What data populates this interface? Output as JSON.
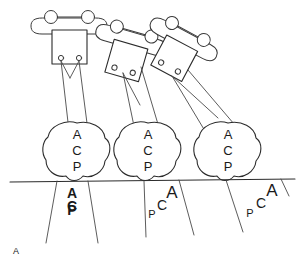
{
  "figure": {
    "panel_label": "A",
    "caption_label": "A",
    "background_color": "#ffffff",
    "ink_color": "#2b2b2b",
    "width": 303,
    "height": 269
  },
  "ground_line": {
    "name": "horizontal-reference-line",
    "y": 180,
    "x_start": 10,
    "x_end": 295
  },
  "devices": [
    {
      "id": "device-left",
      "label": "",
      "rotation_deg": 0,
      "center_x": 66,
      "center_y": 36,
      "port_count": 2,
      "knob_count": 2
    },
    {
      "id": "device-middle",
      "label": "",
      "rotation_deg": 18,
      "center_x": 130,
      "center_y": 46,
      "port_count": 2,
      "knob_count": 2
    },
    {
      "id": "device-right",
      "label": "",
      "rotation_deg": 30,
      "center_x": 176,
      "center_y": 52,
      "port_count": 2,
      "knob_count": 2
    }
  ],
  "somas": [
    {
      "id": "soma-left",
      "center_x": 77,
      "center_y": 150,
      "letters": [
        "A",
        "C",
        "P"
      ]
    },
    {
      "id": "soma-middle",
      "center_x": 148,
      "center_y": 150,
      "letters": [
        "A",
        "C",
        "P"
      ]
    },
    {
      "id": "soma-right",
      "center_x": 228,
      "center_y": 150,
      "letters": [
        "A",
        "C",
        "P"
      ]
    }
  ],
  "below_line_marks": [
    {
      "id": "mark-left",
      "style": "stacked-bold-overlapping",
      "letters": [
        "A",
        "C",
        "P"
      ],
      "x": 73,
      "y": 196
    },
    {
      "id": "mark-middle",
      "style": "diagonal-graded",
      "letters": [
        "A",
        "C",
        "P"
      ],
      "x": 165,
      "y": 200
    },
    {
      "id": "mark-right",
      "style": "diagonal-graded",
      "letters": [
        "A",
        "C",
        "P"
      ],
      "x": 262,
      "y": 198
    }
  ],
  "legend": {
    "letters": [
      "A",
      "C",
      "P"
    ]
  }
}
